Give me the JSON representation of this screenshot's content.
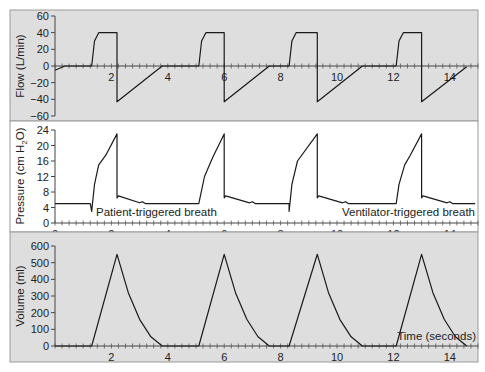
{
  "colors": {
    "panel_gray": "#dedede",
    "panel_white": "#ffffff",
    "frame": "#9a9a9a",
    "trace": "#1a1a1a",
    "text": "#222222"
  },
  "chart_data": [
    {
      "type": "line",
      "title": "",
      "ylabel": "Flow (L/min)",
      "xlabel": "",
      "ylim": [
        -60,
        60
      ],
      "xlim": [
        0,
        15
      ],
      "yticks": [
        "60",
        "40",
        "20",
        "0",
        "-20",
        "-40",
        "-60"
      ],
      "xticks": [
        "2",
        "4",
        "6",
        "8",
        "10",
        "12",
        "14"
      ],
      "grid": false,
      "background": "gray",
      "series": [
        {
          "name": "Flow",
          "x": [
            0,
            0.35,
            1.3,
            1.4,
            1.55,
            2.2,
            2.2,
            3.8,
            5.1,
            5.2,
            5.35,
            6.0,
            6.0,
            7.6,
            8.3,
            8.4,
            8.55,
            9.3,
            9.3,
            10.9,
            12.1,
            12.2,
            12.35,
            13.0,
            13.0,
            14.6
          ],
          "values": [
            -5,
            0,
            0,
            30,
            40,
            40,
            -43,
            0,
            0,
            30,
            40,
            40,
            -43,
            0,
            0,
            30,
            40,
            40,
            -43,
            0,
            0,
            30,
            40,
            40,
            -43,
            -1
          ]
        }
      ]
    },
    {
      "type": "line",
      "title": "",
      "ylabel": "Pressure (cm H2O)",
      "xlabel": "",
      "ylim": [
        0,
        24
      ],
      "xlim": [
        0,
        15
      ],
      "yticks": [
        "24",
        "20",
        "16",
        "12",
        "8",
        "4",
        "0"
      ],
      "xticks": [
        "0",
        "2",
        "4",
        "6",
        "8",
        "10",
        "12",
        "14"
      ],
      "grid": false,
      "background": "white",
      "annotations": [
        "Patient-triggered breath",
        "Ventilator-triggered breath"
      ],
      "series": [
        {
          "name": "Pressure",
          "x": [
            0,
            1.25,
            1.3,
            1.4,
            1.55,
            1.8,
            2.2,
            2.2,
            2.25,
            3.0,
            3.1,
            3.2,
            5.0,
            5.1,
            5.3,
            5.6,
            6.0,
            6.0,
            6.05,
            6.9,
            7.0,
            7.1,
            8.3,
            8.3,
            8.4,
            8.6,
            9.3,
            9.3,
            9.35,
            10.2,
            10.3,
            10.4,
            12.1,
            12.2,
            12.4,
            12.6,
            13.0,
            13.0,
            13.05,
            13.9,
            14.0,
            14.1,
            14.9
          ],
          "values": [
            5,
            5,
            3,
            10,
            15,
            17.5,
            23,
            6.5,
            7,
            5.2,
            5.5,
            5,
            5,
            5,
            12,
            17,
            23,
            6.5,
            7,
            5.2,
            5.5,
            5,
            5,
            3,
            10,
            16,
            23,
            6.5,
            7,
            5.2,
            5.5,
            5,
            5,
            10,
            15,
            17.5,
            23,
            6.5,
            7,
            5.2,
            5.5,
            5,
            5
          ]
        }
      ]
    },
    {
      "type": "line",
      "title": "",
      "ylabel": "Volume (ml)",
      "xlabel": "Time (seconds)",
      "ylim": [
        0,
        600
      ],
      "xlim": [
        0,
        15
      ],
      "yticks": [
        "600",
        "500",
        "400",
        "300",
        "200",
        "100",
        "0"
      ],
      "xticks": [
        "2",
        "4",
        "6",
        "8",
        "10",
        "12",
        "14"
      ],
      "grid": false,
      "background": "gray",
      "series": [
        {
          "name": "Volume",
          "x": [
            0,
            1.3,
            2.2,
            2.6,
            3.0,
            3.4,
            3.8,
            5.1,
            6.0,
            6.4,
            6.8,
            7.2,
            7.6,
            8.3,
            9.3,
            9.7,
            10.1,
            10.5,
            10.9,
            12.1,
            13.0,
            13.4,
            13.8,
            14.2,
            14.6
          ],
          "values": [
            0,
            0,
            550,
            320,
            160,
            55,
            0,
            0,
            550,
            320,
            160,
            55,
            0,
            0,
            550,
            320,
            160,
            55,
            0,
            0,
            550,
            320,
            160,
            55,
            0
          ]
        }
      ]
    }
  ]
}
